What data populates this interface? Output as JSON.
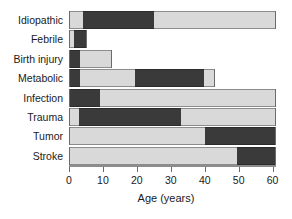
{
  "chart_data": {
    "type": "bar",
    "orientation": "horizontal",
    "subtype": "stacked-range",
    "title": "",
    "subtitle": "",
    "xlabel": "Age (years)",
    "ylabel": "",
    "xlim": [
      0,
      61
    ],
    "xticks": [
      0,
      10,
      20,
      30,
      40,
      50,
      60
    ],
    "xtick_labels": [
      "0",
      "10",
      "20",
      "30",
      "40",
      "50",
      "60"
    ],
    "grid": false,
    "legend": null,
    "legend_position": "none",
    "categories": [
      "Idiopathic",
      "Febrile",
      "Birth injury",
      "Metabolic",
      "Infection",
      "Trauma",
      "Tumor",
      "Stroke"
    ],
    "colors": {
      "light": "#d9d9d9",
      "dark": "#3a3a3a",
      "outline": "#8c8c8c",
      "axis": "#6b6b6b",
      "text": "#1a1a1a",
      "background": "#ffffff"
    },
    "bars": [
      {
        "category": "Idiopathic",
        "start": 0,
        "end": 61,
        "segments": [
          {
            "shade": "light",
            "from": 0,
            "to": 4
          },
          {
            "shade": "dark",
            "from": 4,
            "to": 25
          },
          {
            "shade": "light",
            "from": 25,
            "to": 61
          }
        ]
      },
      {
        "category": "Febrile",
        "start": 0,
        "end": 5.3,
        "segments": [
          {
            "shade": "light",
            "from": 0,
            "to": 1.5
          },
          {
            "shade": "dark",
            "from": 1.5,
            "to": 5.3
          }
        ]
      },
      {
        "category": "Birth injury",
        "start": 0,
        "end": 12.6,
        "segments": [
          {
            "shade": "dark",
            "from": 0,
            "to": 3.2
          },
          {
            "shade": "light",
            "from": 3.2,
            "to": 12.6
          }
        ]
      },
      {
        "category": "Metabolic",
        "start": 0,
        "end": 43,
        "segments": [
          {
            "shade": "dark",
            "from": 0,
            "to": 3.2
          },
          {
            "shade": "light",
            "from": 3.2,
            "to": 19.4
          },
          {
            "shade": "dark",
            "from": 19.4,
            "to": 39.7
          },
          {
            "shade": "light",
            "from": 39.7,
            "to": 43
          }
        ]
      },
      {
        "category": "Infection",
        "start": 0,
        "end": 61,
        "segments": [
          {
            "shade": "dark",
            "from": 0,
            "to": 9.1
          },
          {
            "shade": "light",
            "from": 9.1,
            "to": 61
          }
        ]
      },
      {
        "category": "Trauma",
        "start": 0,
        "end": 61,
        "segments": [
          {
            "shade": "light",
            "from": 0,
            "to": 2.9
          },
          {
            "shade": "dark",
            "from": 2.9,
            "to": 32.9
          },
          {
            "shade": "light",
            "from": 32.9,
            "to": 61
          }
        ]
      },
      {
        "category": "Tumor",
        "start": 0,
        "end": 61,
        "segments": [
          {
            "shade": "light",
            "from": 0,
            "to": 40
          },
          {
            "shade": "dark",
            "from": 40,
            "to": 61
          }
        ]
      },
      {
        "category": "Stroke",
        "start": 0,
        "end": 61,
        "segments": [
          {
            "shade": "light",
            "from": 0,
            "to": 49.4
          },
          {
            "shade": "dark",
            "from": 49.4,
            "to": 61
          }
        ]
      }
    ]
  }
}
